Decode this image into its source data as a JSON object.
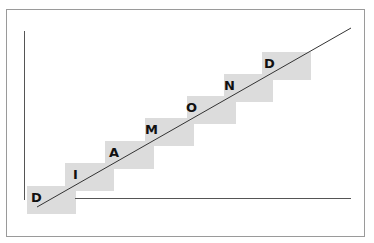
{
  "diagram": {
    "title": "",
    "letters": [
      {
        "char": "D",
        "box": [
          27,
          186
        ],
        "label": [
          31,
          189
        ]
      },
      {
        "char": "I",
        "box": [
          65,
          163
        ],
        "label": [
          73,
          166
        ]
      },
      {
        "char": "A",
        "box": [
          105,
          141
        ],
        "label": [
          109,
          144
        ]
      },
      {
        "char": "M",
        "box": [
          145,
          118
        ],
        "label": [
          145,
          121
        ]
      },
      {
        "char": "O",
        "box": [
          187,
          96
        ],
        "label": [
          185,
          99
        ]
      },
      {
        "char": "N",
        "box": [
          224,
          74
        ],
        "label": [
          223,
          77
        ]
      },
      {
        "char": "D",
        "box": [
          262,
          52
        ],
        "label": [
          263,
          55
        ]
      }
    ],
    "word": "DIAMOND",
    "colors": {
      "box": "#dcdcdc",
      "line": "#333333",
      "axis": "#555555",
      "frame": "#9a9a9a"
    }
  }
}
